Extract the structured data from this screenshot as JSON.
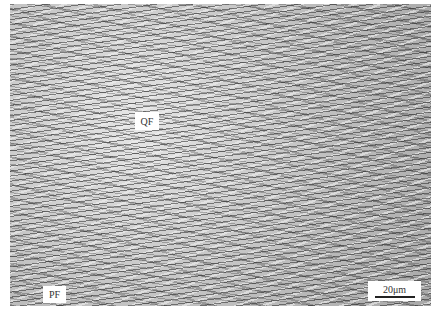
{
  "image": {
    "description": "Optical micrograph of steel microstructure",
    "labels": [
      {
        "text": "QF"
      },
      {
        "text": "PF"
      }
    ],
    "scale_bar": {
      "text": "20μm"
    }
  }
}
